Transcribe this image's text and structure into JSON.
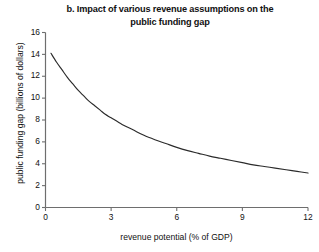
{
  "chart_data": {
    "type": "line",
    "title": "b. Impact of various revenue assumptions on the public funding gap",
    "title_line1": "b. Impact of various revenue assumptions on the",
    "title_line2": "public funding gap",
    "xlabel": "revenue potential (% of GDP)",
    "ylabel": "public funding gap (billions of dollars)",
    "xlim": [
      0,
      12
    ],
    "ylim": [
      0,
      16
    ],
    "xticks": [
      0,
      3,
      6,
      9,
      12
    ],
    "xtick_labels": [
      "0",
      "3",
      "6",
      "9",
      "12"
    ],
    "yticks": [
      0,
      2,
      4,
      6,
      8,
      10,
      12,
      14,
      16
    ],
    "ytick_labels": [
      "0",
      "2",
      "4",
      "6",
      "8",
      "10",
      "12",
      "14",
      "16"
    ],
    "grid": false,
    "legend": null,
    "line_color": "#2b2b2b",
    "axis_color": "#6e6e6e",
    "series": [
      {
        "name": "public funding gap",
        "x": [
          0.25,
          0.5,
          0.75,
          1.0,
          1.25,
          1.5,
          1.75,
          2.0,
          2.25,
          2.5,
          2.75,
          3.0,
          3.5,
          4.0,
          4.5,
          5.0,
          5.5,
          6.0,
          6.5,
          7.0,
          7.5,
          8.0,
          8.5,
          9.0,
          9.5,
          10.0,
          10.5,
          11.0,
          11.5,
          12.0
        ],
        "y": [
          14.1,
          13.3,
          12.6,
          11.9,
          11.3,
          10.7,
          10.2,
          9.7,
          9.3,
          8.9,
          8.5,
          8.2,
          7.6,
          7.1,
          6.6,
          6.2,
          5.85,
          5.5,
          5.2,
          4.95,
          4.7,
          4.5,
          4.3,
          4.1,
          3.9,
          3.75,
          3.6,
          3.45,
          3.3,
          3.15
        ]
      }
    ]
  }
}
